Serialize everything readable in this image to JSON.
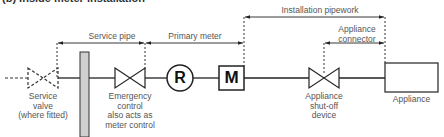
{
  "title": "(b) Inside meter installation",
  "dimensions": {
    "service_pipe": "Service pipe",
    "primary_meter": "Primary meter",
    "installation_pipework": "Installation pipework",
    "appliance_connector": [
      "Appliance",
      "connector"
    ]
  },
  "components": {
    "service_valve": [
      "Service",
      "valve",
      "(where fitted)"
    ],
    "emergency_control": [
      "Emergency",
      "control",
      "also acts as",
      "meter control"
    ],
    "regulator_symbol": "R",
    "meter_symbol": "M",
    "appliance_shutoff": [
      "Appliance",
      "shut-off",
      "device"
    ],
    "appliance": "Appliance"
  },
  "colors": {
    "line": "#222222",
    "wall_fill": "#d0d0d0",
    "text": "#555555"
  }
}
